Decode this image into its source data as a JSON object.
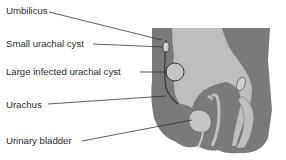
{
  "figure": {
    "labels": [
      {
        "id": "umbilicus",
        "text": "Umbilicus"
      },
      {
        "id": "small-urachal-cyst",
        "text": "Small urachal cyst"
      },
      {
        "id": "large-infected-urachal-cyst",
        "text": "Large infected urachal cyst"
      },
      {
        "id": "urachus",
        "text": "Urachus"
      },
      {
        "id": "urinary-bladder",
        "text": "Urinary bladder"
      }
    ],
    "colors": {
      "dark_tissue": "#7a7a7a",
      "light_tissue": "#bdbdbd",
      "outline": "#3a3a3a",
      "leader_line": "#333333"
    }
  }
}
